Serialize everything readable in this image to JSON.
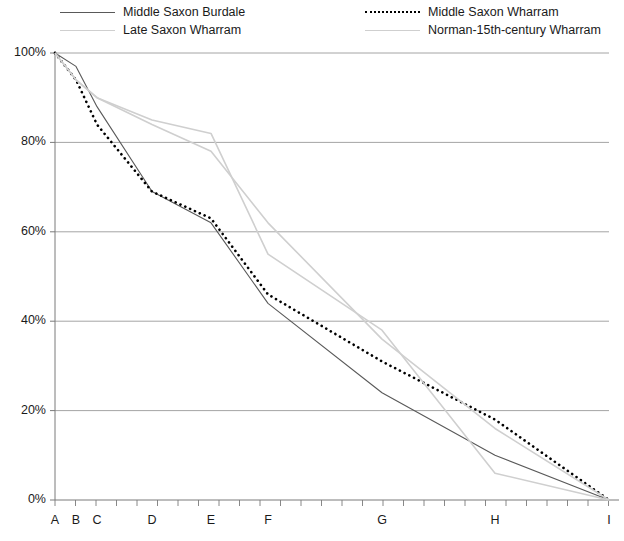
{
  "legend": {
    "items": [
      {
        "label": "Middle Saxon Burdale",
        "style": "solid",
        "color": "#595959",
        "x": 60,
        "y": 4
      },
      {
        "label": "Late Saxon Wharram",
        "style": "solid",
        "color": "#cfcfcf",
        "x": 60,
        "y": 22
      },
      {
        "label": "Middle Saxon Wharram",
        "style": "dotted",
        "color": "#000000",
        "x": 365,
        "y": 4
      },
      {
        "label": "Norman-15th-century Wharram",
        "style": "solid",
        "color": "#cfcfcf",
        "x": 365,
        "y": 22
      }
    ]
  },
  "axes": {
    "y_ticks": [
      "0%",
      "20%",
      "40%",
      "60%",
      "80%",
      "100%"
    ],
    "x_ticks": [
      "A",
      "B",
      "C",
      "D",
      "E",
      "F",
      "G",
      "H",
      "I"
    ]
  },
  "chart_data": {
    "type": "line",
    "title": "",
    "xlabel": "",
    "ylabel": "",
    "ylim": [
      0,
      100
    ],
    "grid": "horizontal",
    "legend_position": "top",
    "categories": [
      "A",
      "B",
      "C",
      "D",
      "E",
      "F",
      "G",
      "H",
      "I"
    ],
    "category_x_px": [
      55,
      76,
      97,
      152,
      211,
      268,
      382,
      495,
      609
    ],
    "series": [
      {
        "name": "Middle Saxon Burdale",
        "style": "solid",
        "color": "#595959",
        "values": [
          100,
          97,
          88,
          69,
          62,
          44,
          24,
          10,
          0
        ],
        "points": [
          {
            "x": "A",
            "y": 100
          },
          {
            "x": "B",
            "y": 97
          },
          {
            "x": "C",
            "y": 88
          },
          {
            "x": "D",
            "y": 69
          },
          {
            "x": "E",
            "y": 62
          },
          {
            "x": "F",
            "y": 44
          },
          {
            "x": "G",
            "y": 24
          },
          {
            "x": "H",
            "y": 10
          },
          {
            "x": "I",
            "y": 0
          }
        ]
      },
      {
        "name": "Middle Saxon Wharram",
        "style": "dotted",
        "color": "#000000",
        "values": [
          100,
          94,
          84,
          69,
          63,
          46,
          31,
          18,
          0
        ],
        "points": [
          {
            "x": "A",
            "y": 100
          },
          {
            "x": "B",
            "y": 94
          },
          {
            "x": "C",
            "y": 84
          },
          {
            "x": "D",
            "y": 69
          },
          {
            "x": "E",
            "y": 63
          },
          {
            "x": "F",
            "y": 46
          },
          {
            "x": "G",
            "y": 31
          },
          {
            "x": "H",
            "y": 18
          },
          {
            "x": "I",
            "y": 0
          }
        ]
      },
      {
        "name": "Late Saxon Wharram",
        "style": "solid",
        "color": "#cfcfcf",
        "values": [
          100,
          94,
          90,
          85,
          82,
          55,
          38,
          6,
          0
        ],
        "points": [
          {
            "x": "A",
            "y": 100
          },
          {
            "x": "B",
            "y": 94
          },
          {
            "x": "C",
            "y": 90
          },
          {
            "x": "D",
            "y": 85
          },
          {
            "x": "E",
            "y": 82
          },
          {
            "x": "F",
            "y": 55
          },
          {
            "x": "G",
            "y": 38
          },
          {
            "x": "H",
            "y": 6
          },
          {
            "x": "I",
            "y": 0
          }
        ]
      },
      {
        "name": "Norman-15th-century Wharram",
        "style": "solid",
        "color": "#cfcfcf",
        "values": [
          100,
          94,
          90,
          84,
          78,
          62,
          36,
          16,
          0
        ],
        "points": [
          {
            "x": "A",
            "y": 100
          },
          {
            "x": "B",
            "y": 94
          },
          {
            "x": "C",
            "y": 90
          },
          {
            "x": "D",
            "y": 84
          },
          {
            "x": "E",
            "y": 78
          },
          {
            "x": "F",
            "y": 62
          },
          {
            "x": "G",
            "y": 36
          },
          {
            "x": "H",
            "y": 16
          },
          {
            "x": "I",
            "y": 0
          }
        ]
      }
    ]
  }
}
